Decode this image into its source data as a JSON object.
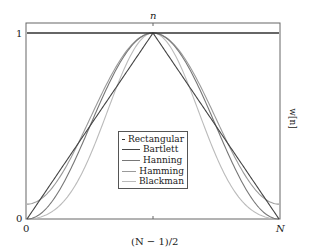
{
  "chart_data": {
    "type": "line",
    "title": "",
    "top_label": "n",
    "xlabel": "(N − 1)/2",
    "ylabel": "w[n]",
    "x_ticks": [
      "0",
      "(N − 1)/2",
      "N"
    ],
    "y_ticks": [
      "0",
      "1"
    ],
    "xlim": [
      0,
      1
    ],
    "ylim": [
      0,
      1.05
    ],
    "grid": false,
    "legend_position": "center-lower",
    "x": [
      0,
      0.05,
      0.1,
      0.15,
      0.2,
      0.25,
      0.3,
      0.35,
      0.4,
      0.45,
      0.5,
      0.55,
      0.6,
      0.65,
      0.7,
      0.75,
      0.8,
      0.85,
      0.9,
      0.95,
      1
    ],
    "series": [
      {
        "name": "Rectangular",
        "color": "#333333",
        "values": [
          1,
          1,
          1,
          1,
          1,
          1,
          1,
          1,
          1,
          1,
          1,
          1,
          1,
          1,
          1,
          1,
          1,
          1,
          1,
          1,
          1
        ]
      },
      {
        "name": "Bartlett",
        "color": "#444444",
        "values": [
          0,
          0.1,
          0.2,
          0.3,
          0.4,
          0.5,
          0.6,
          0.7,
          0.8,
          0.9,
          1,
          0.9,
          0.8,
          0.7,
          0.6,
          0.5,
          0.4,
          0.3,
          0.2,
          0.1,
          0
        ]
      },
      {
        "name": "Hanning",
        "color": "#777777",
        "values": [
          0,
          0.0245,
          0.0955,
          0.2061,
          0.3455,
          0.5,
          0.6545,
          0.7939,
          0.9045,
          0.9755,
          1,
          0.9755,
          0.9045,
          0.7939,
          0.6545,
          0.5,
          0.3455,
          0.2061,
          0.0955,
          0.0245,
          0
        ]
      },
      {
        "name": "Hamming",
        "color": "#9a9a9a",
        "values": [
          0.08,
          0.1025,
          0.1679,
          0.2696,
          0.3979,
          0.54,
          0.6821,
          0.8104,
          0.9121,
          0.9775,
          1,
          0.9775,
          0.9121,
          0.8104,
          0.6821,
          0.54,
          0.3979,
          0.2696,
          0.1679,
          0.1025,
          0.08
        ]
      },
      {
        "name": "Blackman",
        "color": "#bbbbbb",
        "values": [
          0,
          0.0103,
          0.0402,
          0.0902,
          0.2008,
          0.34,
          0.5097,
          0.6892,
          0.8492,
          0.9602,
          1,
          0.9602,
          0.8492,
          0.6892,
          0.5097,
          0.34,
          0.2008,
          0.0902,
          0.0402,
          0.0103,
          0
        ]
      }
    ]
  },
  "labels": {
    "top": "n",
    "y_one": "1",
    "y_zero": "0",
    "x_zero": "0",
    "x_mid": "(N − 1)/2",
    "x_end": "N",
    "ylabel": "w[n]"
  },
  "legend": [
    {
      "label": "Rectangular",
      "color": "#333333"
    },
    {
      "label": "Bartlett",
      "color": "#444444"
    },
    {
      "label": "Hanning",
      "color": "#777777"
    },
    {
      "label": "Hamming",
      "color": "#9a9a9a"
    },
    {
      "label": "Blackman",
      "color": "#bbbbbb"
    }
  ]
}
